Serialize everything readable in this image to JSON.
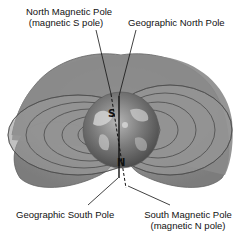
{
  "labels": {
    "north_magnetic_pole": "North Magnetic Pole",
    "north_magnetic_pole_note": "(magnetic S pole)",
    "geographic_north_pole": "Geographic North Pole",
    "geographic_south_pole": "Geographic South Pole",
    "south_magnetic_pole": "South Magnetic Pole",
    "south_magnetic_pole_note": "(magnetic N pole)"
  },
  "globe_markers": {
    "top": "S",
    "bottom": "N"
  },
  "colors": {
    "field_region": "#8f8f8f",
    "field_lines": "#4a4a4a",
    "globe": "#6e6e6e",
    "axis": "#111111"
  }
}
